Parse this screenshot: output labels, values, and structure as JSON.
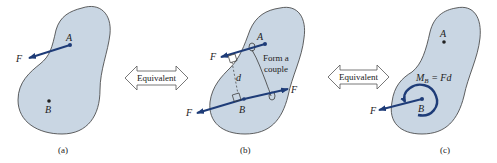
{
  "colors": {
    "body_fill": "#c9d6e3",
    "body_stroke": "#3a3a3a",
    "force": "#1e3c78",
    "text": "#222222",
    "arrow_stroke": "#555555"
  },
  "panels": [
    {
      "id": "a",
      "caption": "(a)",
      "points": {
        "A": "A",
        "B": "B"
      },
      "forces": [
        {
          "label": "F",
          "from": "A"
        }
      ]
    },
    {
      "id": "b",
      "caption": "(b)",
      "points": {
        "A": "A",
        "B": "B"
      },
      "forces": [
        {
          "label": "F",
          "from": "A"
        },
        {
          "label": "F",
          "from": "B",
          "direction": "left"
        },
        {
          "label": "F",
          "from": "B",
          "direction": "right"
        }
      ],
      "distance_label": "d",
      "annotation_line1": "Form a",
      "annotation_line2": "couple"
    },
    {
      "id": "c",
      "caption": "(c)",
      "points": {
        "A": "A",
        "B": "B"
      },
      "forces": [
        {
          "label": "F",
          "from": "B"
        }
      ],
      "moment_label_M": "M",
      "moment_label_sub": "B",
      "moment_label_rest": " = Fd"
    }
  ],
  "equivalence_arrows": [
    {
      "label": "Equivalent"
    },
    {
      "label": "Equivalent"
    }
  ]
}
